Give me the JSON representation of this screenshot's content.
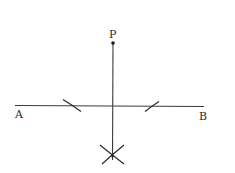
{
  "diagram": {
    "title": "",
    "labels": {
      "point_p": "P",
      "point_a": "A",
      "point_b": "B"
    },
    "colors": {
      "stroke": "#3a3a3a",
      "text": "#2a2a2a",
      "background": "#ffffff"
    },
    "elements": {
      "line_ab": "horizontal line AB",
      "point_p": "point P above line AB",
      "perpendicular": "perpendicular from P to AB",
      "arcs": "construction arcs cutting AB on both sides",
      "intersecting_arcs": "intersecting arcs below AB"
    }
  }
}
